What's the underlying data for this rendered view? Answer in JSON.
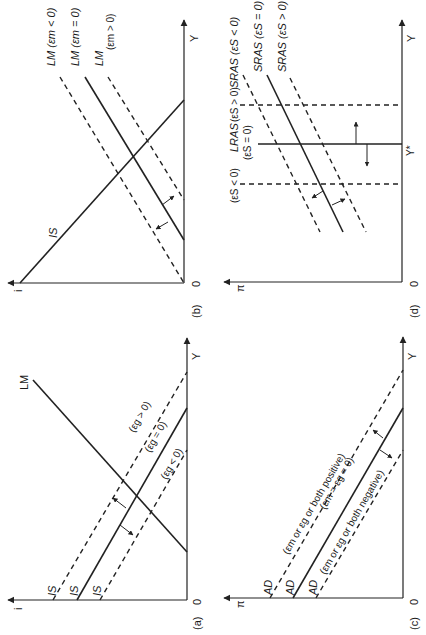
{
  "figure": {
    "orientation": "rotated 90 degrees counter-clockwise",
    "panels": {
      "a": {
        "label": "(a)",
        "origin_label": "0",
        "y_axis_label": "i",
        "x_axis_label": "Y",
        "curves": {
          "lm": "LM",
          "is_upper": "IS",
          "is_mid": "IS",
          "is_lower": "IS",
          "eg_pos": "(εg > 0)",
          "eg_zero": "(εg = 0)",
          "eg_neg": "(εg < 0)"
        }
      },
      "b": {
        "label": "(b)",
        "origin_label": "0",
        "y_axis_label": "i",
        "x_axis_label": "Y",
        "curves": {
          "is": "IS",
          "lm_neg": "LM (εm < 0)",
          "lm_zero": "LM (εm = 0)",
          "lm_pos_a": "LM",
          "lm_pos_b": "(εm > 0)"
        }
      },
      "c": {
        "label": "(c)",
        "origin_label": "0",
        "y_axis_label": "π",
        "x_axis_label": "Y",
        "curves": {
          "ad_upper": "AD",
          "ad_mid": "AD",
          "ad_lower": "AD",
          "pos": "(εm or εg or both positive)",
          "zero": "(εm = εg = 0)",
          "neg": "(εm or εg or both negative)"
        }
      },
      "d": {
        "label": "(d)",
        "origin_label": "0",
        "y_axis_label": "π",
        "x_axis_label": "Y",
        "y_star": "Y*",
        "curves": {
          "es_neg": "(εS < 0)",
          "lras": "LRAS",
          "es_zero": "(εS = 0)",
          "lras_pos": "(εS > 0)",
          "sras_neg": "SRAS (εS < 0)",
          "sras_zero": "SRAS (εS = 0)",
          "sras_pos": "SRAS (εS > 0)"
        }
      }
    }
  }
}
